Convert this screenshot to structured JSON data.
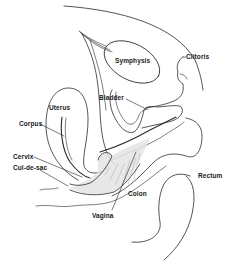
{
  "diagram": {
    "type": "anatomical-sagittal-section",
    "colors": {
      "background": "#ffffff",
      "line": "#2a2a2a",
      "shading": "#e4e4e4"
    },
    "labels": {
      "symphysis": "Symphysis",
      "clitoris": "Clitoris",
      "bladder": "Bladder",
      "uterus": "Uterus",
      "corpus": "Corpus",
      "cervix": "Cervix",
      "cul_de_sac": "Cul-de-sac",
      "rectum": "Rectum",
      "colon": "Colon",
      "vagina": "Vagina"
    }
  }
}
